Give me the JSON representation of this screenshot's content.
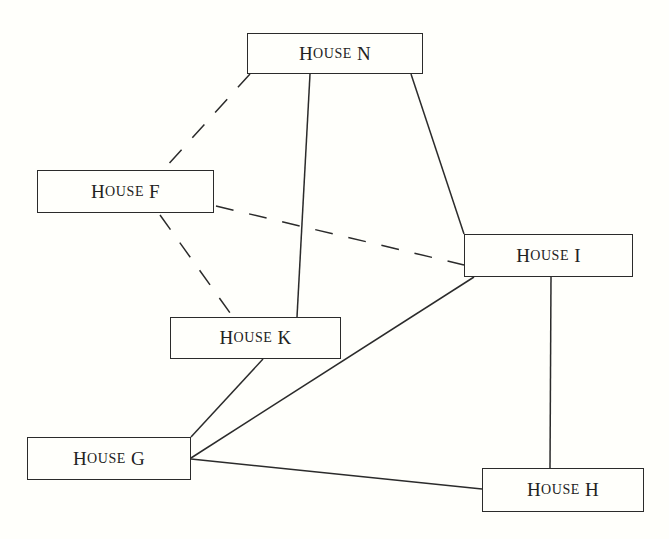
{
  "diagram": {
    "type": "network-graph",
    "nodes": [
      {
        "id": "N",
        "label": "House N",
        "word_cap": "H",
        "word_rest": "ouse",
        "letter": "N",
        "x": 247,
        "y": 33,
        "w": 176,
        "h": 41
      },
      {
        "id": "F",
        "label": "House F",
        "word_cap": "H",
        "word_rest": "ouse",
        "letter": "F",
        "x": 37,
        "y": 170,
        "w": 177,
        "h": 43
      },
      {
        "id": "I",
        "label": "House I",
        "word_cap": "H",
        "word_rest": "ouse",
        "letter": "I",
        "x": 464,
        "y": 234,
        "w": 169,
        "h": 43
      },
      {
        "id": "K",
        "label": "House K",
        "word_cap": "H",
        "word_rest": "ouse",
        "letter": "K",
        "x": 170,
        "y": 317,
        "w": 171,
        "h": 42
      },
      {
        "id": "G",
        "label": "House G",
        "word_cap": "H",
        "word_rest": "ouse",
        "letter": "G",
        "x": 27,
        "y": 437,
        "w": 164,
        "h": 43
      },
      {
        "id": "H",
        "label": "House H",
        "word_cap": "H",
        "word_rest": "ouse",
        "letter": "H",
        "x": 482,
        "y": 468,
        "w": 162,
        "h": 44
      }
    ],
    "edges": [
      {
        "from": "N",
        "to": "F",
        "style": "dashed",
        "x1": 250,
        "y1": 74,
        "x2": 165,
        "y2": 168
      },
      {
        "from": "N",
        "to": "K",
        "style": "solid",
        "x1": 310,
        "y1": 74,
        "x2": 297,
        "y2": 317
      },
      {
        "from": "N",
        "to": "I",
        "style": "solid",
        "x1": 411,
        "y1": 74,
        "x2": 464,
        "y2": 234
      },
      {
        "from": "F",
        "to": "I",
        "style": "dashed",
        "x1": 216,
        "y1": 206,
        "x2": 464,
        "y2": 265
      },
      {
        "from": "F",
        "to": "K",
        "style": "dashed",
        "x1": 160,
        "y1": 215,
        "x2": 233,
        "y2": 317
      },
      {
        "from": "K",
        "to": "G",
        "style": "solid",
        "x1": 263,
        "y1": 359,
        "x2": 191,
        "y2": 437
      },
      {
        "from": "I",
        "to": "G",
        "style": "solid",
        "x1": 474,
        "y1": 277,
        "x2": 191,
        "y2": 458
      },
      {
        "from": "I",
        "to": "H",
        "style": "solid",
        "x1": 551,
        "y1": 277,
        "x2": 550,
        "y2": 468
      },
      {
        "from": "G",
        "to": "H",
        "style": "solid",
        "x1": 191,
        "y1": 459,
        "x2": 482,
        "y2": 489
      }
    ],
    "colors": {
      "background": "#fffffb",
      "stroke": "#2b2b2b",
      "text": "#222222"
    }
  }
}
